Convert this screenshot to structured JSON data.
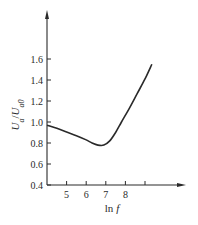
{
  "chart_data": {
    "type": "line",
    "title": "",
    "xlabel": "ln f",
    "ylabel": "U_a/U_a0",
    "xlim": [
      4,
      10
    ],
    "ylim": [
      0.4,
      1.8
    ],
    "x_ticks": [
      5,
      6,
      7,
      8,
      9
    ],
    "x_tick_labels": [
      "5",
      "6",
      "7",
      "8",
      ""
    ],
    "y_ticks": [
      0.4,
      0.6,
      0.8,
      1.0,
      1.2,
      1.4,
      1.6
    ],
    "y_tick_labels": [
      "0.4",
      "0.6",
      "0.8",
      "1.0",
      "1.2",
      "1.4",
      "1.6"
    ],
    "grid": false,
    "legend": null,
    "series": [
      {
        "name": "U_a/U_a0",
        "x": [
          4.0,
          4.5,
          5.0,
          5.5,
          6.0,
          6.3,
          6.6,
          6.9,
          7.2,
          7.5,
          7.8,
          8.2,
          8.6,
          9.0,
          9.35
        ],
        "y": [
          0.97,
          0.94,
          0.905,
          0.87,
          0.83,
          0.8,
          0.78,
          0.78,
          0.82,
          0.9,
          1.0,
          1.13,
          1.27,
          1.41,
          1.55
        ]
      }
    ],
    "color": "#2a2a2a"
  }
}
